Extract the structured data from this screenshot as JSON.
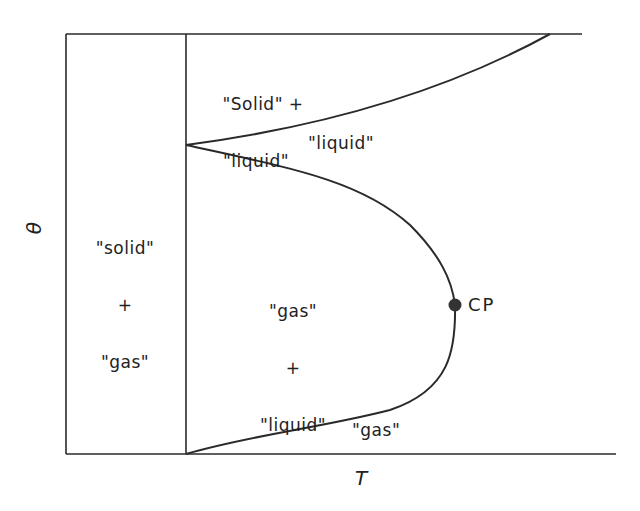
{
  "diagram": {
    "type": "phase-diagram",
    "axes": {
      "x_label": "T",
      "y_label": "θ"
    },
    "regions": {
      "solid_gas": [
        "\"solid\"",
        "+",
        "\"gas\""
      ],
      "solid_liquid": [
        "\"Solid\" +",
        "\"liquid\""
      ],
      "liquid": "\"liquid\"",
      "gas_liquid": [
        "\"gas\"",
        "+",
        "\"liquid\""
      ],
      "gas": "\"gas\""
    },
    "critical_point": {
      "label": "CP"
    },
    "colors": {
      "line": "#2a2a2a",
      "background": "#ffffff"
    }
  }
}
